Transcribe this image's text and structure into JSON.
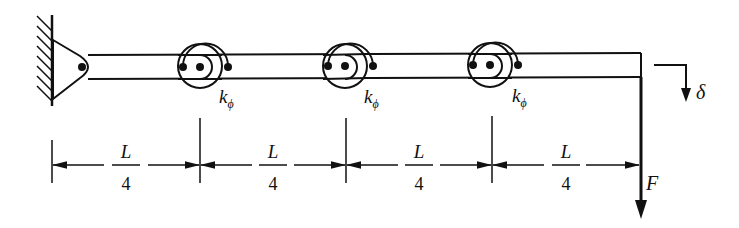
{
  "diagram": {
    "type": "beam-with-rotational-springs",
    "support": {
      "type": "pin",
      "x": 82,
      "y": 67
    },
    "beam": {
      "x_start": 82,
      "x_end": 641,
      "top": 54,
      "bottom": 78
    },
    "hinges": [
      {
        "x": 200,
        "y": 66,
        "spring_label": "k",
        "spring_subscript": "ϕ"
      },
      {
        "x": 345,
        "y": 66,
        "spring_label": "k",
        "spring_subscript": "ϕ"
      },
      {
        "x": 490,
        "y": 65,
        "spring_label": "k",
        "spring_subscript": "ϕ"
      }
    ],
    "load": {
      "label": "F",
      "direction": "down"
    },
    "deflection": {
      "label": "δ",
      "direction": "down"
    },
    "dimensions": [
      {
        "numerator": "L",
        "denominator": "4"
      },
      {
        "numerator": "L",
        "denominator": "4"
      },
      {
        "numerator": "L",
        "denominator": "4"
      },
      {
        "numerator": "L",
        "denominator": "4"
      }
    ]
  },
  "colors": {
    "ink": "#111111",
    "background": "#ffffff"
  }
}
